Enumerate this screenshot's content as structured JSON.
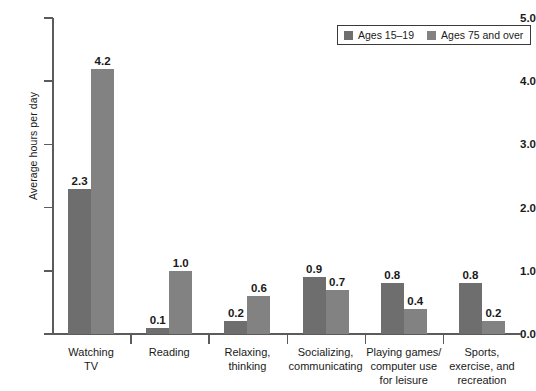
{
  "chart_data": {
    "type": "bar",
    "title": "",
    "xlabel": "",
    "ylabel": "Average hours per day",
    "ylim": [
      0.0,
      5.0
    ],
    "ytick_labels": [
      "0.0",
      "1.0",
      "2.0",
      "3.0",
      "4.0",
      "5.0"
    ],
    "ytick_values": [
      0.0,
      1.0,
      2.0,
      3.0,
      4.0,
      5.0
    ],
    "grid": false,
    "legend_position": "top-right",
    "categories": [
      "Watching\nTV",
      "Reading",
      "Relaxing,\nthinking",
      "Socializing,\ncommunicating",
      "Playing games/\ncomputer use\nfor leisure",
      "Sports,\nexercise, and\nrecreation"
    ],
    "category_lines": [
      [
        "Watching",
        "TV"
      ],
      [
        "Reading"
      ],
      [
        "Relaxing,",
        "thinking"
      ],
      [
        "Socializing,",
        "communicating"
      ],
      [
        "Playing games/",
        "computer use",
        "for leisure"
      ],
      [
        "Sports,",
        "exercise, and",
        "recreation"
      ]
    ],
    "series": [
      {
        "name": "Ages 15–19",
        "color": "#6e6e6e",
        "values": [
          2.3,
          0.1,
          0.2,
          0.9,
          0.8,
          0.8
        ],
        "value_labels": [
          "2.3",
          "0.1",
          "0.2",
          "0.9",
          "0.8",
          "0.8"
        ]
      },
      {
        "name": "Ages 75 and over",
        "color": "#828282",
        "values": [
          4.2,
          1.0,
          0.6,
          0.7,
          0.4,
          0.2
        ],
        "value_labels": [
          "4.2",
          "1.0",
          "0.6",
          "0.7",
          "0.4",
          "0.2"
        ]
      }
    ]
  },
  "legend": {
    "items": [
      {
        "label": "Ages 15–19",
        "swatch": "legend-swatch-ages-15-19"
      },
      {
        "label": "Ages 75 and over",
        "swatch": "legend-swatch-ages-75-over"
      }
    ]
  },
  "axis": {
    "y_title": "Average hours per day"
  }
}
